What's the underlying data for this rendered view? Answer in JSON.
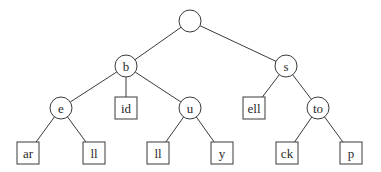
{
  "diagram": {
    "type": "trie",
    "nodes": [
      {
        "id": "root",
        "label": "",
        "shape": "circle"
      },
      {
        "id": "b",
        "label": "b",
        "shape": "circle",
        "parent": "root"
      },
      {
        "id": "s",
        "label": "s",
        "shape": "circle",
        "parent": "root"
      },
      {
        "id": "e",
        "label": "e",
        "shape": "circle",
        "parent": "b"
      },
      {
        "id": "id",
        "label": "id",
        "shape": "box",
        "parent": "b"
      },
      {
        "id": "u",
        "label": "u",
        "shape": "circle",
        "parent": "b"
      },
      {
        "id": "ell",
        "label": "ell",
        "shape": "box",
        "parent": "s"
      },
      {
        "id": "to",
        "label": "to",
        "shape": "circle",
        "parent": "s"
      },
      {
        "id": "ar",
        "label": "ar",
        "shape": "box",
        "parent": "e"
      },
      {
        "id": "e-ll",
        "label": "ll",
        "shape": "box",
        "parent": "e"
      },
      {
        "id": "u-ll",
        "label": "ll",
        "shape": "box",
        "parent": "u"
      },
      {
        "id": "y",
        "label": "y",
        "shape": "box",
        "parent": "u"
      },
      {
        "id": "ck",
        "label": "ck",
        "shape": "box",
        "parent": "to"
      },
      {
        "id": "p",
        "label": "p",
        "shape": "box",
        "parent": "to"
      }
    ]
  }
}
